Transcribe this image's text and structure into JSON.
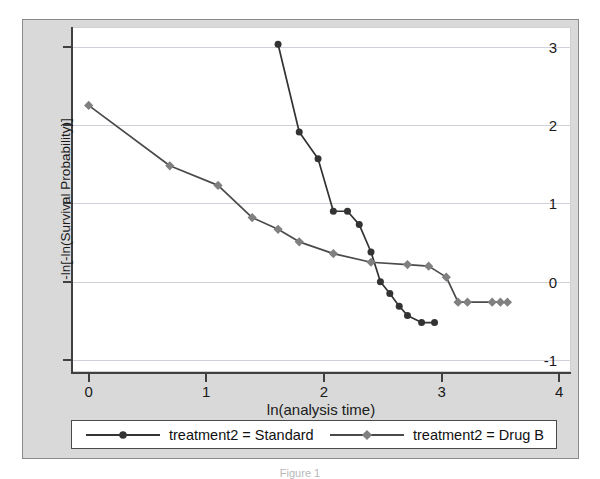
{
  "figure": {
    "background_color": "#d9d9d9",
    "plot_background_color": "#ffffff",
    "caption": "Figure 1"
  },
  "chart_data": {
    "type": "line",
    "title": "",
    "subtitle": "",
    "xlabel": "ln(analysis time)",
    "ylabel": "-ln[-ln(Survival Probability)]",
    "xlim": [
      -0.15,
      4.1
    ],
    "ylim": [
      -1.15,
      3.25
    ],
    "xticks": [
      0,
      1,
      2,
      3,
      4
    ],
    "xticklabels": [
      "0",
      "1",
      "2",
      "3",
      "4"
    ],
    "yticks": [
      -1,
      0,
      1,
      2,
      3
    ],
    "yticklabels": [
      "-1",
      "0",
      "1",
      "2",
      "3"
    ],
    "grid": "horizontal",
    "grid_color": "#d0d0d8",
    "legend_position": "below",
    "series": [
      {
        "name": "treatment2 = Standard",
        "color": "#333333",
        "marker": "circle",
        "marker_size": 7,
        "x": [
          1.61,
          1.79,
          1.95,
          2.08,
          2.2,
          2.3,
          2.4,
          2.48,
          2.56,
          2.64,
          2.71,
          2.83,
          2.94
        ],
        "y": [
          3.03,
          1.91,
          1.57,
          0.9,
          0.9,
          0.73,
          0.38,
          0.0,
          -0.15,
          -0.31,
          -0.43,
          -0.52,
          -0.52
        ]
      },
      {
        "name": "treatment2 = Drug B",
        "color": "#808080",
        "marker": "diamond",
        "marker_size": 8,
        "x": [
          0.0,
          0.69,
          1.1,
          1.39,
          1.61,
          1.79,
          2.08,
          2.4,
          2.71,
          2.89,
          3.04,
          3.14,
          3.22,
          3.43,
          3.5,
          3.56
        ],
        "y": [
          2.25,
          1.48,
          1.23,
          0.82,
          0.67,
          0.51,
          0.36,
          0.25,
          0.22,
          0.2,
          0.06,
          -0.26,
          -0.26,
          -0.26,
          -0.26,
          -0.26
        ]
      }
    ]
  },
  "legend": {
    "entries": [
      {
        "label": "treatment2 = Standard",
        "color": "#333333",
        "marker": "circle"
      },
      {
        "label": "treatment2 = Drug B",
        "color": "#808080",
        "marker": "diamond"
      }
    ]
  }
}
